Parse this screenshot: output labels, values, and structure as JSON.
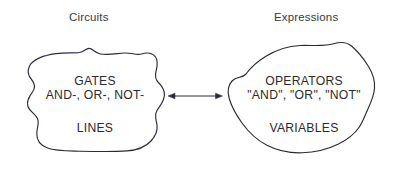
{
  "diagram": {
    "title_left": "Circuits",
    "title_right": "Expressions",
    "left_group": {
      "line1": "GATES",
      "line2": "AND-, OR-, NOT-",
      "line3": "LINES"
    },
    "right_group": {
      "line1": "OPERATORS",
      "line2": "\"AND\", \"OR\", \"NOT\"",
      "line3": "VARIABLES"
    },
    "connector": {
      "name": "double-headed-arrow",
      "direction": "bidirectional"
    },
    "colors": {
      "background": "#ffffff",
      "stroke": "#2a2a3c",
      "text": "#2b2b2d",
      "heading_text": "#3a3a3c"
    }
  }
}
